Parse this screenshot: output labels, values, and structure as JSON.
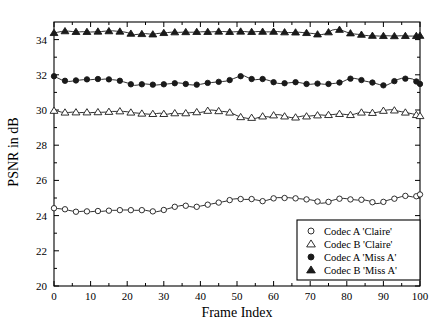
{
  "chart_data": {
    "type": "line",
    "title": "",
    "xlabel": "Frame Index",
    "ylabel": "PSNR in dB",
    "xlim": [
      0,
      100
    ],
    "ylim": [
      20,
      35
    ],
    "xticks": [
      0,
      10,
      20,
      30,
      40,
      50,
      60,
      70,
      80,
      90,
      100
    ],
    "yticks": [
      20,
      22,
      24,
      26,
      28,
      30,
      32,
      34
    ],
    "xtick_labels": [
      "0",
      "10",
      "20",
      "30",
      "40",
      "50",
      "60",
      "70",
      "80",
      "90",
      "100"
    ],
    "ytick_labels": [
      "20",
      "22",
      "24",
      "26",
      "28",
      "30",
      "32",
      "34"
    ],
    "grid": false,
    "legend_position": "lower-right",
    "x": [
      0,
      1,
      2,
      3,
      4,
      5,
      6,
      7,
      8,
      9,
      10,
      11,
      12,
      13,
      14,
      15,
      16,
      17,
      18,
      19,
      20,
      21,
      22,
      23,
      24,
      25,
      26,
      27,
      28,
      29,
      30,
      31,
      32,
      33,
      34,
      35,
      36,
      37,
      38,
      39,
      40,
      41,
      42,
      43,
      44,
      45,
      46,
      47,
      48,
      49,
      50,
      51,
      52,
      53,
      54,
      55,
      56,
      57,
      58,
      59,
      60,
      61,
      62,
      63,
      64,
      65,
      66,
      67,
      68,
      69,
      70,
      71,
      72,
      73,
      74,
      75,
      76,
      77,
      78,
      79,
      80,
      81,
      82,
      83,
      84,
      85,
      86,
      87,
      88,
      89,
      90,
      91,
      92,
      93,
      94,
      95,
      96,
      97,
      98,
      99,
      100
    ],
    "series": [
      {
        "name": "Codec A 'Claire'",
        "marker": "open-circle",
        "values": [
          24.42,
          24.4,
          24.38,
          24.36,
          24.3,
          24.26,
          24.22,
          24.23,
          24.25,
          24.24,
          24.22,
          24.24,
          24.26,
          24.24,
          24.26,
          24.28,
          24.3,
          24.3,
          24.31,
          24.32,
          24.32,
          24.31,
          24.3,
          24.3,
          24.31,
          24.3,
          24.26,
          24.24,
          24.22,
          24.26,
          24.32,
          24.38,
          24.44,
          24.5,
          24.54,
          24.58,
          24.56,
          24.52,
          24.48,
          24.5,
          24.54,
          24.58,
          24.62,
          24.66,
          24.7,
          24.74,
          24.78,
          24.82,
          24.88,
          24.94,
          24.96,
          24.94,
          24.92,
          24.92,
          24.94,
          24.9,
          24.86,
          24.82,
          24.86,
          24.92,
          24.98,
          25.02,
          25.02,
          25.0,
          25.02,
          25.0,
          24.98,
          24.96,
          24.94,
          24.92,
          24.9,
          24.86,
          24.8,
          24.7,
          24.72,
          24.78,
          24.86,
          24.92,
          24.96,
          24.98,
          24.96,
          24.92,
          24.9,
          24.88,
          24.9,
          24.88,
          24.84,
          24.76,
          24.68,
          24.7,
          24.78,
          24.86,
          24.92,
          24.96,
          25.02,
          25.08,
          25.12,
          25.1,
          25.06,
          25.1,
          25.2
        ]
      },
      {
        "name": "Codec B 'Claire'",
        "marker": "open-triangle",
        "values": [
          29.96,
          29.94,
          29.88,
          29.86,
          29.86,
          29.88,
          29.87,
          29.85,
          29.86,
          29.87,
          29.85,
          29.86,
          29.88,
          29.87,
          29.88,
          29.9,
          29.92,
          29.92,
          29.93,
          29.92,
          29.9,
          29.86,
          29.84,
          29.82,
          29.8,
          29.78,
          29.76,
          29.78,
          29.8,
          29.82,
          29.78,
          29.76,
          29.8,
          29.82,
          29.8,
          29.78,
          29.82,
          29.84,
          29.86,
          29.88,
          29.86,
          29.9,
          29.96,
          30.0,
          29.98,
          29.94,
          29.92,
          29.9,
          29.86,
          29.78,
          29.68,
          29.6,
          29.56,
          29.52,
          29.56,
          29.52,
          29.58,
          29.64,
          29.62,
          29.6,
          29.7,
          29.74,
          29.72,
          29.64,
          29.6,
          29.56,
          29.58,
          29.62,
          29.66,
          29.64,
          29.66,
          29.68,
          29.7,
          29.72,
          29.7,
          29.72,
          29.74,
          29.76,
          29.78,
          29.76,
          29.74,
          29.72,
          29.76,
          29.82,
          29.86,
          29.88,
          29.86,
          29.84,
          29.86,
          29.9,
          29.96,
          30.0,
          30.02,
          29.98,
          29.94,
          29.9,
          29.86,
          29.82,
          29.78,
          29.72,
          29.66
        ]
      },
      {
        "name": "Codec A 'Miss A'",
        "marker": "filled-circle",
        "values": [
          31.92,
          31.82,
          31.72,
          31.66,
          31.62,
          31.64,
          31.68,
          31.7,
          31.72,
          31.74,
          31.72,
          31.74,
          31.76,
          31.74,
          31.76,
          31.74,
          31.72,
          31.7,
          31.66,
          31.6,
          31.54,
          31.46,
          31.4,
          31.42,
          31.46,
          31.48,
          31.46,
          31.44,
          31.42,
          31.44,
          31.46,
          31.48,
          31.5,
          31.52,
          31.54,
          31.52,
          31.48,
          31.44,
          31.42,
          31.44,
          31.46,
          31.5,
          31.54,
          31.56,
          31.58,
          31.6,
          31.62,
          31.64,
          31.7,
          31.78,
          31.86,
          31.92,
          31.94,
          31.84,
          31.76,
          31.72,
          31.74,
          31.76,
          31.72,
          31.66,
          31.58,
          31.52,
          31.5,
          31.52,
          31.54,
          31.56,
          31.58,
          31.56,
          31.52,
          31.48,
          31.46,
          31.48,
          31.5,
          31.48,
          31.46,
          31.48,
          31.5,
          31.52,
          31.56,
          31.62,
          31.72,
          31.78,
          31.8,
          31.76,
          31.7,
          31.64,
          31.6,
          31.56,
          31.5,
          31.44,
          31.4,
          31.42,
          31.52,
          31.64,
          31.74,
          31.8,
          31.78,
          31.8,
          31.76,
          31.62,
          31.48
        ]
      },
      {
        "name": "Codec B 'Miss A'",
        "marker": "filled-triangle",
        "values": [
          34.38,
          34.42,
          34.46,
          34.48,
          34.48,
          34.46,
          34.44,
          34.44,
          34.45,
          34.44,
          34.43,
          34.44,
          34.46,
          34.46,
          34.48,
          34.48,
          34.5,
          34.48,
          34.46,
          34.44,
          34.4,
          34.34,
          34.28,
          34.3,
          34.32,
          34.34,
          34.32,
          34.3,
          34.34,
          34.36,
          34.38,
          34.4,
          34.42,
          34.42,
          34.41,
          34.42,
          34.43,
          34.42,
          34.42,
          34.44,
          34.44,
          34.45,
          34.44,
          34.44,
          34.45,
          34.46,
          34.46,
          34.45,
          34.44,
          34.44,
          34.45,
          34.46,
          34.46,
          34.44,
          34.44,
          34.45,
          34.46,
          34.45,
          34.44,
          34.44,
          34.45,
          34.46,
          34.44,
          34.42,
          34.4,
          34.4,
          34.41,
          34.42,
          34.4,
          34.38,
          34.36,
          34.34,
          34.3,
          34.28,
          34.32,
          34.42,
          34.54,
          34.58,
          34.56,
          34.5,
          34.42,
          34.36,
          34.32,
          34.3,
          34.28,
          34.24,
          34.22,
          34.22,
          34.21,
          34.2,
          34.21,
          34.22,
          34.21,
          34.2,
          34.21,
          34.22,
          34.21,
          34.2,
          34.2,
          34.21,
          34.22
        ]
      }
    ]
  },
  "legend": {
    "entries": [
      {
        "label": "Codec A 'Claire'",
        "marker": "open-circle"
      },
      {
        "label": "Codec B 'Claire'",
        "marker": "open-triangle"
      },
      {
        "label": "Codec A 'Miss A'",
        "marker": "filled-circle"
      },
      {
        "label": "Codec B 'Miss A'",
        "marker": "filled-triangle"
      }
    ]
  },
  "colors": {
    "line": "#1a1a1a",
    "axis": "#000000",
    "background": "#ffffff"
  }
}
